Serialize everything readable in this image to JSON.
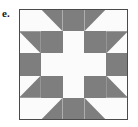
{
  "figure": {
    "label": "e.",
    "kind": "quilt-block-pattern"
  },
  "colors": {
    "shaded": "#7e7e7e",
    "background": "#fbfbfb",
    "border": "#4a4a4a",
    "label_text": "#1a1a1a",
    "page": "#ffffff"
  },
  "block": {
    "grid_rows": 5,
    "grid_cols": 5,
    "cell_size": 21.8,
    "outer_border_width": 1,
    "x": 19,
    "y": 9,
    "width": 109,
    "height": 111,
    "cells": [
      [
        {
          "row": 0,
          "col": 0,
          "type": "square",
          "fill": "background"
        },
        {
          "row": 0,
          "col": 1,
          "type": "triangle",
          "corner": "top-right",
          "fill": "shaded"
        },
        {
          "row": 0,
          "col": 2,
          "type": "square",
          "fill": "shaded"
        },
        {
          "row": 0,
          "col": 3,
          "type": "triangle",
          "corner": "top-left",
          "fill": "shaded"
        },
        {
          "row": 0,
          "col": 4,
          "type": "square",
          "fill": "background"
        }
      ],
      [
        {
          "row": 1,
          "col": 0,
          "type": "triangle",
          "corner": "top-right",
          "fill": "shaded"
        },
        {
          "row": 1,
          "col": 1,
          "type": "square",
          "fill": "shaded"
        },
        {
          "row": 1,
          "col": 2,
          "type": "square",
          "fill": "background"
        },
        {
          "row": 1,
          "col": 3,
          "type": "square",
          "fill": "shaded"
        },
        {
          "row": 1,
          "col": 4,
          "type": "triangle",
          "corner": "top-left",
          "fill": "shaded"
        }
      ],
      [
        {
          "row": 2,
          "col": 0,
          "type": "square",
          "fill": "shaded"
        },
        {
          "row": 2,
          "col": 1,
          "type": "square",
          "fill": "background"
        },
        {
          "row": 2,
          "col": 2,
          "type": "square",
          "fill": "background"
        },
        {
          "row": 2,
          "col": 3,
          "type": "square",
          "fill": "background"
        },
        {
          "row": 2,
          "col": 4,
          "type": "square",
          "fill": "shaded"
        }
      ],
      [
        {
          "row": 3,
          "col": 0,
          "type": "triangle",
          "corner": "bottom-right",
          "fill": "shaded"
        },
        {
          "row": 3,
          "col": 1,
          "type": "square",
          "fill": "shaded"
        },
        {
          "row": 3,
          "col": 2,
          "type": "square",
          "fill": "background"
        },
        {
          "row": 3,
          "col": 3,
          "type": "square",
          "fill": "shaded"
        },
        {
          "row": 3,
          "col": 4,
          "type": "triangle",
          "corner": "bottom-left",
          "fill": "shaded"
        }
      ],
      [
        {
          "row": 4,
          "col": 0,
          "type": "square",
          "fill": "background"
        },
        {
          "row": 4,
          "col": 1,
          "type": "triangle",
          "corner": "bottom-right",
          "fill": "shaded"
        },
        {
          "row": 4,
          "col": 2,
          "type": "square",
          "fill": "shaded"
        },
        {
          "row": 4,
          "col": 3,
          "type": "triangle",
          "corner": "bottom-left",
          "fill": "shaded"
        },
        {
          "row": 4,
          "col": 4,
          "type": "square",
          "fill": "background"
        }
      ]
    ]
  }
}
